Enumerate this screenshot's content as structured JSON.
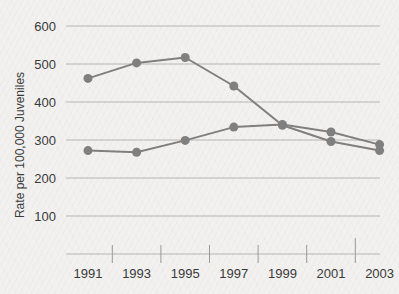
{
  "chart_data": {
    "type": "line",
    "title": "",
    "subtitle": "",
    "xlabel": "",
    "ylabel": "Rate per 100,000 Juveniles",
    "categories": [
      "1991",
      "1993",
      "1995",
      "1997",
      "1999",
      "2001",
      "2003"
    ],
    "x": [
      1991,
      1993,
      1995,
      1997,
      1999,
      2001,
      2003
    ],
    "xlim": [
      1990,
      2004
    ],
    "ylim": [
      0,
      640
    ],
    "yticks": [
      100,
      200,
      300,
      400,
      500,
      600
    ],
    "ytick_labels": [
      "100",
      "200",
      "300",
      "400",
      "500",
      "600"
    ],
    "grid": "horizontal",
    "legend": "none",
    "series": [
      {
        "name": "series-upper",
        "color": "#808080",
        "values": [
          462,
          503,
          517,
          442,
          339,
          296,
          272
        ]
      },
      {
        "name": "series-lower",
        "color": "#808080",
        "values": [
          272,
          268,
          299,
          334,
          341,
          321,
          288
        ]
      }
    ],
    "marker": "circle",
    "marker_size": 9,
    "line_width": 2,
    "colors": {
      "background": "#f2f1ef",
      "gridline": "#b6b6b6",
      "axis": "#9a9a9a",
      "text": "#3a3a3a",
      "series": "#808080"
    }
  }
}
